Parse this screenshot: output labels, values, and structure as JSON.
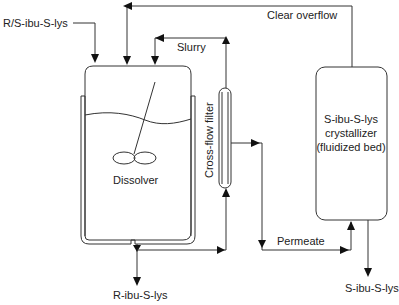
{
  "diagram": {
    "colors": {
      "line": "#333333",
      "text": "#222222",
      "background": "#ffffff"
    },
    "units": {
      "dissolver": {
        "label": "Dissolver"
      },
      "filter": {
        "label": "Cross-flow filter"
      },
      "crystallizer": {
        "label_lines": [
          "S-ibu-S-lys",
          "crystallizer",
          "(fluidized bed)"
        ]
      }
    },
    "streams": {
      "feed": "R/S-ibu-S-lys",
      "clear_overflow": "Clear overflow",
      "slurry": "Slurry",
      "permeate": "Permeate",
      "r_product": "R-ibu-S-lys",
      "s_product": "S-ibu-S-lys"
    }
  }
}
